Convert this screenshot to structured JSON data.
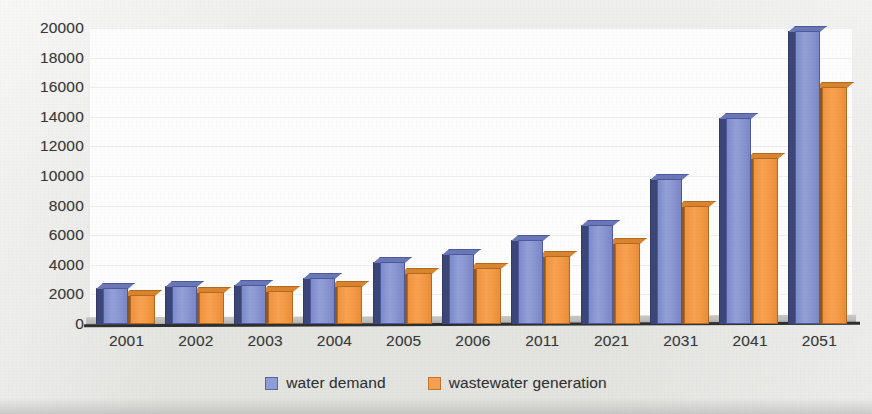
{
  "chart_data": {
    "type": "bar",
    "title": "",
    "xlabel": "",
    "ylabel": "",
    "ylim": [
      0,
      20000
    ],
    "ytick_step": 2000,
    "yticks": [
      "20000",
      "18000",
      "16000",
      "14000",
      "12000",
      "10000",
      "8000",
      "6000",
      "4000",
      "2000",
      "0"
    ],
    "grid": true,
    "legend_position": "bottom-center",
    "style_note": "3D clustered column chart, scanned page",
    "categories": [
      "2001",
      "2002",
      "2003",
      "2004",
      "2005",
      "2006",
      "2011",
      "2021",
      "2031",
      "2041",
      "2051"
    ],
    "series": [
      {
        "name": "water demand",
        "color": "#8f9cd6",
        "values": [
          2400,
          2600,
          2650,
          3100,
          4200,
          4700,
          5700,
          6700,
          9800,
          13900,
          19800
        ]
      },
      {
        "name": "wastewater generation",
        "color": "#f6a052",
        "values": [
          1950,
          2150,
          2200,
          2550,
          3450,
          3800,
          4600,
          5500,
          8000,
          11200,
          16000
        ]
      }
    ]
  },
  "legend": {
    "items": [
      {
        "label": "water demand",
        "swatch": "blue-square-swatch"
      },
      {
        "label": "wastewater generation",
        "swatch": "orange-square-swatch"
      }
    ]
  }
}
